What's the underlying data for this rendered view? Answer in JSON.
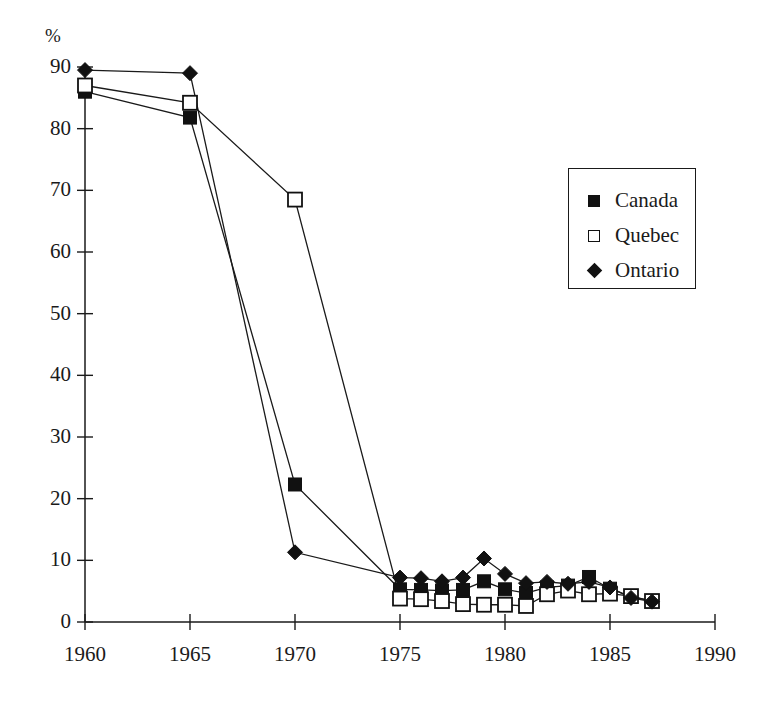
{
  "axis": {
    "y_title": "%",
    "y_ticks": [
      0,
      10,
      20,
      30,
      40,
      50,
      60,
      70,
      80,
      90
    ],
    "x_ticks": [
      1960,
      1965,
      1970,
      1975,
      1980,
      1985,
      1990
    ]
  },
  "legend": {
    "entries": [
      {
        "label": "Canada",
        "marker": "filled-square"
      },
      {
        "label": "Quebec",
        "marker": "open-square"
      },
      {
        "label": "Ontario",
        "marker": "filled-diamond"
      }
    ]
  },
  "chart_data": {
    "type": "line",
    "title": "",
    "xlabel": "",
    "ylabel": "%",
    "xlim": [
      1960,
      1990
    ],
    "ylim": [
      0,
      90
    ],
    "grid": false,
    "legend_position": "upper-right",
    "x": [
      1960,
      1965,
      1970,
      1975,
      1976,
      1977,
      1978,
      1979,
      1980,
      1981,
      1982,
      1983,
      1984,
      1985,
      1986,
      1987
    ],
    "series": [
      {
        "name": "Canada",
        "marker": "filled-square",
        "values": [
          86.0,
          81.8,
          22.3,
          5.3,
          5.2,
          5.1,
          5.2,
          6.6,
          5.3,
          4.7,
          5.6,
          5.9,
          7.3,
          5.4,
          4.1,
          3.4
        ]
      },
      {
        "name": "Quebec",
        "marker": "open-square",
        "values": [
          87.0,
          84.2,
          68.5,
          3.8,
          3.7,
          3.4,
          2.9,
          2.8,
          2.8,
          2.6,
          4.5,
          5.1,
          4.5,
          4.6,
          4.2,
          3.4
        ]
      },
      {
        "name": "Ontario",
        "marker": "filled-diamond",
        "values": [
          89.5,
          89.0,
          11.3,
          7.2,
          7.1,
          6.6,
          7.2,
          10.3,
          7.8,
          6.3,
          6.5,
          6.2,
          6.5,
          5.6,
          3.9,
          3.3
        ]
      }
    ]
  }
}
